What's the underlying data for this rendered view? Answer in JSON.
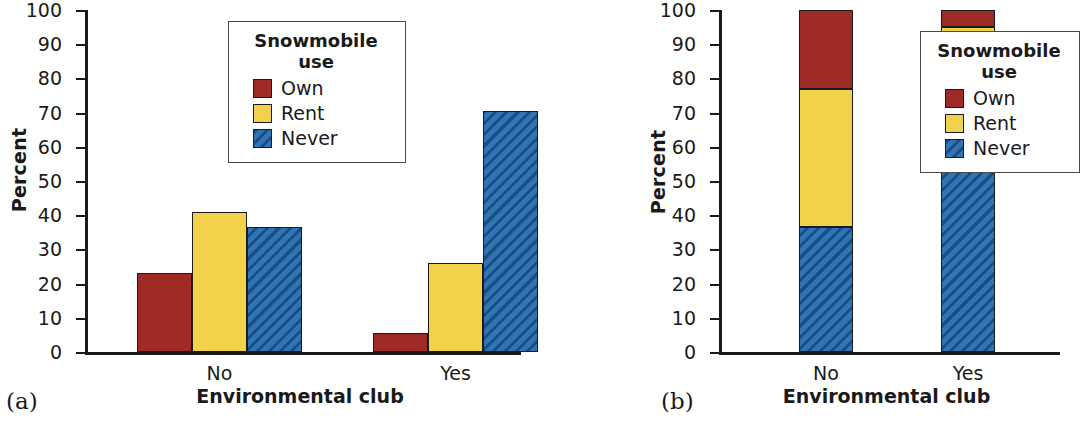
{
  "figure": {
    "panels": [
      {
        "tag": "(a)",
        "ylabel": "Percent",
        "xlabel": "Environmental club"
      },
      {
        "tag": "(b)",
        "ylabel": "Percent",
        "xlabel": "Environmental club"
      }
    ],
    "legend": {
      "title_line1": "Snowmobile",
      "title_line2": "use",
      "entries": [
        {
          "label": "Own",
          "color": "#9e2b26",
          "pattern": "solid"
        },
        {
          "label": "Rent",
          "color": "#f2d24b",
          "pattern": "solid"
        },
        {
          "label": "Never",
          "color": "#2f74b5",
          "pattern": "diagonal-hatch"
        }
      ]
    },
    "yticks": [
      "100",
      "90",
      "80",
      "70",
      "60",
      "50",
      "40",
      "30",
      "20",
      "10",
      "0"
    ],
    "xticks": [
      "No",
      "Yes"
    ]
  },
  "chart_data": [
    {
      "type": "bar",
      "title": "",
      "panel": "(a)",
      "grouping": "grouped",
      "xlabel": "Environmental club",
      "ylabel": "Percent",
      "ylim": [
        0,
        100
      ],
      "ytick_step": 10,
      "grid": false,
      "legend_position": "top-center-right",
      "categories": [
        "No",
        "Yes"
      ],
      "series": [
        {
          "name": "Own",
          "color": "#9e2b26",
          "values": [
            23.0,
            5.6
          ]
        },
        {
          "name": "Rent",
          "color": "#f2d24b",
          "values": [
            41.0,
            26.0
          ]
        },
        {
          "name": "Never",
          "color": "#2f74b5",
          "values": [
            36.6,
            70.4
          ]
        }
      ]
    },
    {
      "type": "bar",
      "title": "",
      "panel": "(b)",
      "grouping": "stacked",
      "xlabel": "Environmental club",
      "ylabel": "Percent",
      "ylim": [
        0,
        100
      ],
      "ytick_step": 10,
      "grid": false,
      "legend_position": "right",
      "categories": [
        "No",
        "Yes"
      ],
      "stack_order_bottom_to_top": [
        "Never",
        "Rent",
        "Own"
      ],
      "series": [
        {
          "name": "Never",
          "color": "#2f74b5",
          "values": [
            36.6,
            70.0
          ]
        },
        {
          "name": "Rent",
          "color": "#f2d24b",
          "values": [
            40.4,
            25.0
          ]
        },
        {
          "name": "Own",
          "color": "#9e2b26",
          "values": [
            23.0,
            5.0
          ]
        }
      ]
    }
  ]
}
